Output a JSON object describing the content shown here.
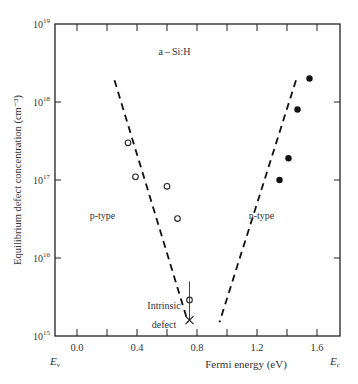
{
  "chart_data": {
    "type": "scatter",
    "xlabel": "Fermi  energy (eV)",
    "ylabel": "Equilibrium defect concentration  (cm⁻³)",
    "xlim": [
      -0.15,
      1.75
    ],
    "ylim": [
      1000000000000000.0,
      1e+19
    ],
    "yscale": "log",
    "x_ticks": [
      0.0,
      0.2,
      0.4,
      0.6,
      0.8,
      1.0,
      1.2,
      1.4,
      1.6
    ],
    "x_tick_labels": [
      "0.0",
      "",
      "0.4",
      "",
      "0.8",
      "",
      "1.2",
      "",
      "1.6"
    ],
    "y_ticks": [
      15,
      16,
      17,
      18,
      19
    ],
    "y_tick_labels": [
      "10",
      "10",
      "10",
      "10",
      "10"
    ],
    "y_tick_exponents": [
      "15",
      "16",
      "17",
      "18",
      "19"
    ],
    "x_edge_labels": {
      "left": "E",
      "left_sub": "v",
      "right": "E",
      "right_sub": "c"
    },
    "grid": false,
    "annotations": [
      {
        "text": "a – Si:H",
        "x": 0.65,
        "y_log": 18.6
      },
      {
        "text": "p-type",
        "x": 0.17,
        "y_log": 16.5
      },
      {
        "text": "n-type",
        "x": 1.23,
        "y_log": 16.5
      },
      {
        "text": "Intrinsic",
        "x": 0.58,
        "y_log": 15.35
      },
      {
        "text": "defect",
        "x": 0.58,
        "y_log": 15.1
      }
    ],
    "series": [
      {
        "name": "p-type (open circles)",
        "marker": "open-circle",
        "x": [
          0.34,
          0.39,
          0.6,
          0.67,
          0.75
        ],
        "y": [
          3e+17,
          1.1e+17,
          8.3e+16,
          3.2e+16,
          2900000000000000.0
        ]
      },
      {
        "name": "n-type (filled circles)",
        "marker": "filled-circle",
        "x": [
          1.55,
          1.47,
          1.41,
          1.35
        ],
        "y": [
          2e+18,
          8e+17,
          1.9e+17,
          1e+17
        ]
      },
      {
        "name": "Intrinsic defect",
        "marker": "x",
        "x": [
          0.75
        ],
        "y": [
          1600000000000000.0
        ],
        "error_bar": {
          "x": 0.75,
          "y_low": 1600000000000000.0,
          "y_high": 5000000000000000.0
        }
      },
      {
        "name": "p-type trend",
        "style": "dashed",
        "x": [
          0.25,
          0.74
        ],
        "y": [
          1.9e+18,
          1500000000000000.0
        ]
      },
      {
        "name": "n-type trend",
        "style": "dashed",
        "x": [
          1.46,
          0.95
        ],
        "y": [
          1.9e+18,
          1500000000000000.0
        ]
      }
    ]
  }
}
